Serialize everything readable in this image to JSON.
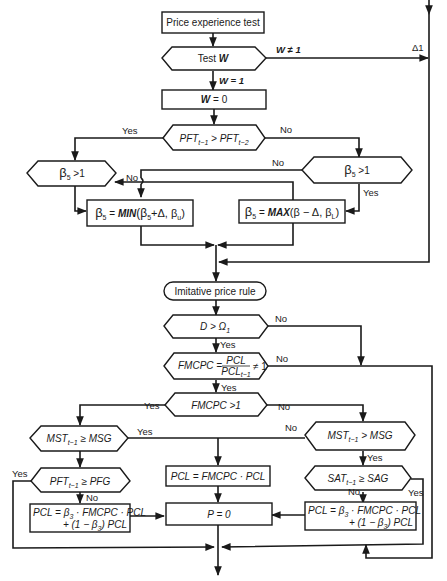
{
  "title": "Price experience test",
  "nodes": {
    "start": "Price experience test",
    "test_w": "Test W",
    "w_zero": "W = 0",
    "pft_compare": "PFT t-1 > PFT t-2",
    "beta_gt1_left": "β5 > 1",
    "beta_gt1_right": "β5 > 1",
    "beta_min": "β5 = MIN(β5 + Δ, βu)",
    "beta_max": "β5 = MAX(β − Δ, βL)",
    "imitative": "Imitative price rule",
    "d_omega": "D > Ω1",
    "fmcpc_ratio": "FMCPC = PCL / PCL t-1 ≠ 1",
    "fmcpc_gt1": "FMCPC > 1",
    "mst_ge_msg": "MST t-1 ≥ MSG",
    "mst_gt_msg": "MST t-1 > MSG",
    "pft_ge_pfg": "PFT t-1 ≥ PFG",
    "sat_ge_sag": "SAT t-1 ≥ SAG",
    "pcl_mult": "PCL = FMCPC · PCL",
    "pcl_left_l1": "PCL = β3 · FMCPC · PCL",
    "pcl_left_l2": "+ (1 − β3) PCL",
    "pcl_right_l1": "PCL = β3 · FMCPC · PCL",
    "pcl_right_l2": "+ (1 − β3) PCL",
    "p_zero": "P = 0"
  },
  "edge_labels": {
    "w_ne_1": "W ≠ 1",
    "w_eq_1": "W = 1",
    "delta1": "Δ1",
    "yes": "Yes",
    "no": "No"
  },
  "text": {
    "test": "Test ",
    "W": "W",
    "eq0": " = 0",
    "PFT": "PFT",
    "t1": "t−1",
    "t2": "t−2",
    "gt": " > ",
    "beta": "β",
    "s5": "5",
    "s3": "3",
    "gt1": " >1",
    "min_a": " = ",
    "min_b": "MIN",
    "min_c": "(β",
    "min_d": "+Δ, β",
    "u": "u",
    "close": ")",
    "max_b": "MAX",
    "max_c": "(β − Δ, β",
    "L": "L",
    "D": "D",
    "Omega": "Ω",
    "one": "1",
    "FMCPC": "FMCPC",
    "eqs": " = ",
    "PCL": "PCL",
    "ne1": "≠ 1",
    "fgt1": "FMCPC >1",
    "MST": "MST",
    "ge": " ≥ ",
    "MSG": "MSG",
    "PFG": "PFG",
    "SAT": "SAT",
    "SAG": "SAG",
    "pcl_mult": "PCL = FMCPC · PCL",
    "pcl_eq": "PCL = β",
    "pcl_rest": " · FMCPC · PCL",
    "pcl_l2a": "+ (1 − β",
    "pcl_l2b": ") PCL",
    "p0": "P = 0"
  }
}
